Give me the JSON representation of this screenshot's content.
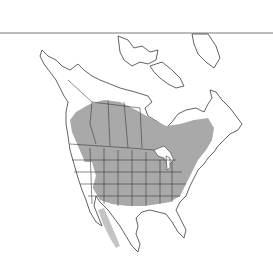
{
  "map": {
    "region": "North America",
    "type": "species range map",
    "colors": {
      "background": "#ffffff",
      "range_fill": "#a9a9a9",
      "range_fill_light": "#c4c4c4",
      "outline": "#3a3a3a",
      "top_rule": "#7a7a7a"
    },
    "legend": []
  }
}
